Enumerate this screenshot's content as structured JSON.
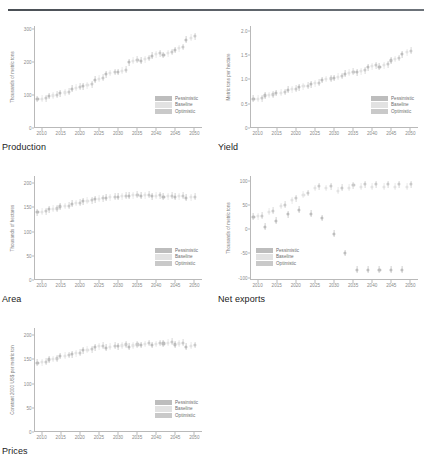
{
  "legend": {
    "items": [
      {
        "label": "Pessimistic",
        "color": "#bdbdbd"
      },
      {
        "label": "Baseline",
        "color": "#e2e2e2"
      },
      {
        "label": "Optimistic",
        "color": "#c9c9c9"
      }
    ]
  },
  "xticks": [
    "2010",
    "2015",
    "2020",
    "2025",
    "2030",
    "2035",
    "2040",
    "2045",
    "2050"
  ],
  "charts": [
    {
      "key": "production",
      "title": "Production",
      "chart_data": {
        "type": "scatter",
        "title": "Production",
        "xlabel": "",
        "ylabel": "Thousands of metric tons",
        "xlim": [
          2008,
          2052
        ],
        "ylim": [
          0,
          310
        ],
        "yticks": [
          0,
          100,
          200,
          300
        ],
        "ytick_labels": [
          "0",
          "100",
          "200",
          "300"
        ],
        "grid": false,
        "legend_position": "bottom-right",
        "x": [
          2010,
          2013,
          2016,
          2019,
          2022,
          2025,
          2028,
          2031,
          2034,
          2037,
          2040,
          2043,
          2046,
          2049
        ],
        "series": [
          {
            "name": "Pessimistic",
            "values": [
              88,
              97,
              106,
              119,
              127,
              147,
              163,
              170,
              200,
              205,
              220,
              222,
              237,
              268
            ]
          },
          {
            "name": "Baseline",
            "values": [
              89,
              99,
              108,
              122,
              130,
              150,
              167,
              174,
              204,
              209,
              224,
              227,
              242,
              274
            ]
          },
          {
            "name": "Optimistic",
            "values": [
              90,
              101,
              110,
              125,
              133,
              153,
              170,
              177,
              207,
              213,
              227,
              231,
              246,
              279
            ]
          }
        ]
      }
    },
    {
      "key": "yield",
      "title": "Yield",
      "chart_data": {
        "type": "scatter",
        "title": "Yield",
        "xlabel": "",
        "ylabel": "Metric tons per hectare",
        "xlim": [
          2008,
          2052
        ],
        "ylim": [
          0,
          2.1
        ],
        "yticks": [
          0,
          0.5,
          1.0,
          1.5,
          2.0
        ],
        "ytick_labels": [
          "0",
          "0.5",
          "1.0",
          "1.5",
          "2.0"
        ],
        "grid": false,
        "legend_position": "bottom-right",
        "x": [
          2010,
          2013,
          2016,
          2019,
          2022,
          2025,
          2028,
          2031,
          2034,
          2037,
          2040,
          2043,
          2046,
          2049
        ],
        "series": [
          {
            "name": "Pessimistic",
            "values": [
              0.6,
              0.67,
              0.72,
              0.79,
              0.84,
              0.9,
              0.99,
              1.03,
              1.12,
              1.15,
              1.25,
              1.26,
              1.39,
              1.52
            ]
          },
          {
            "name": "Baseline",
            "values": [
              0.6,
              0.68,
              0.73,
              0.8,
              0.86,
              0.92,
              1.01,
              1.06,
              1.14,
              1.17,
              1.27,
              1.29,
              1.42,
              1.56
            ]
          },
          {
            "name": "Optimistic",
            "values": [
              0.61,
              0.69,
              0.74,
              0.81,
              0.87,
              0.93,
              1.02,
              1.07,
              1.16,
              1.19,
              1.29,
              1.31,
              1.44,
              1.59
            ]
          }
        ]
      }
    },
    {
      "key": "area",
      "title": "Area",
      "chart_data": {
        "type": "scatter",
        "title": "Area",
        "xlabel": "",
        "ylabel": "Thousands of hectares",
        "xlim": [
          2008,
          2052
        ],
        "ylim": [
          0,
          215
        ],
        "yticks": [
          0,
          50,
          100,
          150,
          200
        ],
        "ytick_labels": [
          "0",
          "50",
          "100",
          "150",
          "200"
        ],
        "grid": false,
        "legend_position": "bottom-right",
        "x": [
          2010,
          2013,
          2016,
          2019,
          2022,
          2025,
          2028,
          2031,
          2034,
          2037,
          2040,
          2043,
          2046,
          2049
        ],
        "series": [
          {
            "name": "Pessimistic",
            "values": [
              140,
              146,
              152,
              158,
              163,
              167,
              170,
              172,
              174,
              174,
              173,
              172,
              172,
              170
            ]
          },
          {
            "name": "Baseline",
            "values": [
              141,
              147,
              153,
              159,
              164,
              168,
              171,
              173,
              175,
              175,
              174,
              173,
              173,
              171
            ]
          },
          {
            "name": "Optimistic",
            "values": [
              142,
              148,
              154,
              160,
              165,
              169,
              172,
              174,
              176,
              176,
              175,
              174,
              174,
              172
            ]
          }
        ]
      }
    },
    {
      "key": "net-exports",
      "title": "Net exports",
      "chart_data": {
        "type": "scatter",
        "title": "Net exports",
        "xlabel": "",
        "ylabel": "Thousands of metric tons",
        "xlim": [
          2008,
          2052
        ],
        "ylim": [
          -105,
          110
        ],
        "yticks": [
          -100,
          -50,
          0,
          50,
          100
        ],
        "ytick_labels": [
          "-100",
          "-50",
          "0",
          "50",
          "100"
        ],
        "grid": false,
        "legend_position": "bottom-left",
        "x": [
          2010,
          2013,
          2016,
          2019,
          2022,
          2025,
          2028,
          2031,
          2034,
          2037,
          2040,
          2043,
          2046,
          2049
        ],
        "series": [
          {
            "name": "Pessimistic",
            "values": [
              26,
              5,
              18,
              31,
              40,
              32,
              23,
              -9,
              -49,
              -84,
              -84,
              -84,
              -84,
              -84
            ]
          },
          {
            "name": "Baseline",
            "values": [
              27,
              36,
              48,
              60,
              71,
              85,
              85,
              80,
              86,
              88,
              88,
              88,
              88,
              88
            ]
          },
          {
            "name": "Optimistic",
            "values": [
              28,
              38,
              51,
              64,
              75,
              89,
              89,
              86,
              91,
              93,
              93,
              93,
              93,
              93
            ]
          }
        ]
      }
    },
    {
      "key": "prices",
      "title": "Prices",
      "chart_data": {
        "type": "scatter",
        "title": "Prices",
        "xlabel": "",
        "ylabel": "Constant 2000 US$ per metric ton",
        "xlim": [
          2008,
          2052
        ],
        "ylim": [
          0,
          215
        ],
        "yticks": [
          0,
          50,
          100,
          150,
          200
        ],
        "ytick_labels": [
          "0",
          "50",
          "100",
          "150",
          "200"
        ],
        "grid": false,
        "legend_position": "bottom-right",
        "x": [
          2010,
          2013,
          2016,
          2019,
          2022,
          2025,
          2028,
          2031,
          2034,
          2037,
          2040,
          2043,
          2046,
          2049
        ],
        "series": [
          {
            "name": "Pessimistic",
            "values": [
              143,
              150,
              157,
              161,
              169,
              175,
              174,
              177,
              176,
              180,
              180,
              183,
              181,
              176
            ]
          },
          {
            "name": "Baseline",
            "values": [
              144,
              151,
              158,
              163,
              170,
              177,
              176,
              179,
              179,
              182,
              182,
              185,
              183,
              178
            ]
          },
          {
            "name": "Optimistic",
            "values": [
              145,
              152,
              159,
              164,
              171,
              178,
              178,
              181,
              181,
              184,
              184,
              187,
              185,
              180
            ]
          }
        ]
      }
    }
  ]
}
